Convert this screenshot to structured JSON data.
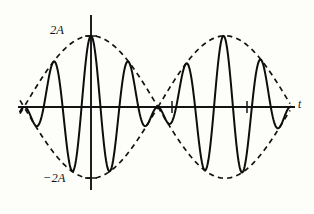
{
  "figure": {
    "name": "beats-waveform",
    "background_color": "#fdfdfa",
    "ink_color": "#121212"
  },
  "axes": {
    "x_axis": {
      "label": "t",
      "label_style": "italic",
      "y_pixel": 107,
      "x_start": 18,
      "x_end": 295
    },
    "y_axis": {
      "x_pixel": 91,
      "y_top": 15,
      "y_bottom": 190,
      "labels": [
        {
          "text": "2A",
          "value": 2,
          "y_pixel": 36
        },
        {
          "text": "−2A",
          "value": -2,
          "y_pixel": 178
        }
      ]
    },
    "ticks": {
      "x_axis_tick_positions": [
        172,
        247
      ],
      "y_axis_tick_positions": [
        36,
        178
      ]
    }
  },
  "chart_data": {
    "type": "line",
    "title": "",
    "xlabel": "t",
    "ylabel": "",
    "xlim": [
      -1.815,
      2.67
    ],
    "ylim": [
      -2.35,
      2.35
    ],
    "grid": false,
    "legend": false,
    "series": [
      {
        "name": "resultant-wave",
        "style": "solid",
        "color": "#0d0d0d",
        "formula": "y = 2A cos(pi*t/2) * cos(2*pi*3.54*t)",
        "carrier_cycles_per_envelope_hump": 3.54,
        "peak_amplitude": 2
      },
      {
        "name": "envelope-upper",
        "style": "dashed",
        "color": "#121212",
        "formula": "y = 2A |cos(pi*t/2)|",
        "peak_amplitude": 2
      },
      {
        "name": "envelope-lower",
        "style": "dashed",
        "color": "#121212",
        "formula": "y = -2A |cos(pi*t/2)|",
        "peak_amplitude": -2
      }
    ],
    "envelope_nodes_t": [
      -1.815,
      1.0,
      2.67
    ],
    "envelope_antinodes_t": [
      0,
      2
    ],
    "annotations": [
      {
        "text": "2A",
        "t": 0,
        "y": 2
      },
      {
        "text": "−2A",
        "t": 0,
        "y": -2
      },
      {
        "text": "t",
        "t": 2.8,
        "y": 0
      }
    ]
  }
}
